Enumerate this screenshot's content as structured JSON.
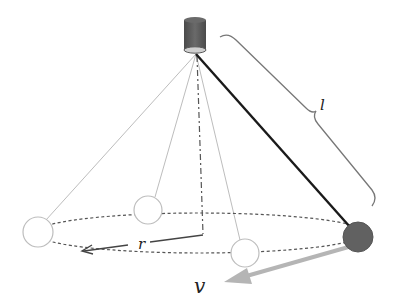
{
  "diagram": {
    "labels": {
      "length": "l",
      "radius": "r",
      "velocity": "v"
    },
    "colors": {
      "bob": "#616161",
      "bob_stroke": "#555555",
      "string": "#1a1a1a",
      "ghost": "#bdbdbd",
      "velocity_arrow": "#b5b5b5",
      "mount": "#5a5a5a",
      "orbit": "#555555"
    },
    "geometry": {
      "pivot": [
        196,
        54
      ],
      "orbit_center": [
        200,
        233
      ],
      "orbit_rx": 165,
      "orbit_ry": 20,
      "bob": [
        358,
        237
      ],
      "bob_radius": 15,
      "ghost_positions": [
        [
          38,
          232
        ],
        [
          148,
          210
        ],
        [
          245,
          253
        ]
      ]
    }
  }
}
